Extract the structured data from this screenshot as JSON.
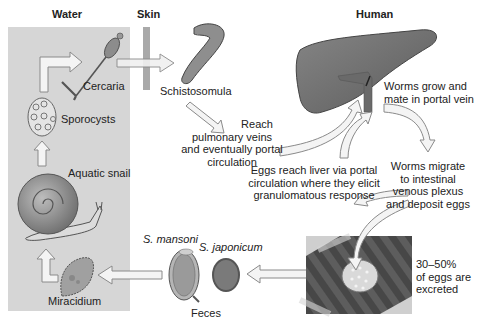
{
  "diagram": {
    "type": "life-cycle",
    "regions": {
      "water": "Water",
      "skin": "Skin",
      "human": "Human"
    },
    "stages": {
      "cercaria": "Cercaria",
      "sporocysts": "Sporocysts",
      "aquatic_snail": "Aquatic snail",
      "miracidium": "Miracidium",
      "schistosomula": "Schistosomula",
      "feces": "Feces",
      "s_mansoni": "S. mansoni",
      "s_japonicum": "S. japonicum"
    },
    "steps": {
      "reach_pulmonary": [
        "Reach",
        "pulmonary veins",
        "and eventually portal",
        "circulation"
      ],
      "worms_grow": [
        "Worms grow and",
        "mate in portal vein"
      ],
      "worms_migrate": [
        "Worms migrate",
        "to intestinal",
        "venous plexus",
        "and deposit eggs"
      ],
      "eggs_reach_liver": [
        "Eggs reach liver via portal",
        "circulation where they elicit",
        "granulomatous response"
      ],
      "eggs_excreted": [
        "30–50%",
        "of eggs are",
        "excreted"
      ]
    },
    "colors": {
      "water_bg": "#d6d6d6",
      "skin_bar": "#a8a8a8",
      "liver": "#6f6f6f",
      "arrow_fill": "#f2f2f2",
      "arrow_stroke": "#8a8a8a",
      "intestine": "#5a5a5a"
    }
  }
}
